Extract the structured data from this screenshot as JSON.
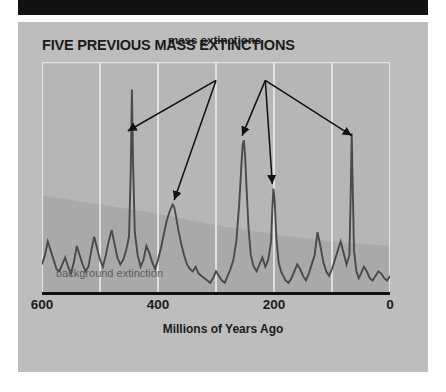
{
  "figure": {
    "title": "FIVE PREVIOUS MASS EXTINCTIONS",
    "annotation_label": "mass extinctions",
    "background_label": "background extinction",
    "axis_caption": "Millions of Years Ago",
    "colors": {
      "banner": "#121212",
      "panel": "#bdbdbd",
      "gridline": "#e3e3e3",
      "curve": "#4a4a4a",
      "band": "#a9a9a9",
      "axis": "#111111",
      "text": "#1b1b1b",
      "muted_text": "#5c5c5c"
    }
  },
  "chart_data": {
    "type": "line",
    "title": "FIVE PREVIOUS MASS EXTINCTIONS",
    "xlabel": "Millions of Years Ago",
    "ylabel": "",
    "xlim": [
      600,
      0
    ],
    "ylim": [
      0,
      100
    ],
    "x_ticks": [
      600,
      400,
      200,
      0
    ],
    "x_tick_labels": [
      "600",
      "400",
      "200",
      "0"
    ],
    "gridlines_x": [
      600,
      500,
      400,
      300,
      200,
      100,
      0
    ],
    "grid": true,
    "legend": "none",
    "annotations": [
      {
        "text": "mass extinctions",
        "x": 300,
        "y": 96
      },
      {
        "text": "background extinction",
        "x": 520,
        "y": 8
      }
    ],
    "arrows": [
      {
        "from_x": 300,
        "from_y": 92,
        "to_x": 452,
        "to_y": 70
      },
      {
        "from_x": 300,
        "from_y": 92,
        "to_x": 372,
        "to_y": 40
      },
      {
        "from_x": 215,
        "from_y": 92,
        "to_x": 255,
        "to_y": 68
      },
      {
        "from_x": 215,
        "from_y": 92,
        "to_x": 203,
        "to_y": 47
      },
      {
        "from_x": 215,
        "from_y": 92,
        "to_x": 66,
        "to_y": 68
      }
    ],
    "mass_extinction_events": [
      {
        "name": "Ordovician",
        "x": 445,
        "y": 88
      },
      {
        "name": "Devonian",
        "x": 372,
        "y": 38
      },
      {
        "name": "Permian",
        "x": 252,
        "y": 66
      },
      {
        "name": "Triassic",
        "x": 201,
        "y": 45
      },
      {
        "name": "Cretaceous",
        "x": 66,
        "y": 69
      }
    ],
    "background_band": {
      "description": "shaded background extinction envelope declining left to right",
      "x": [
        600,
        500,
        400,
        300,
        200,
        100,
        0
      ],
      "y_top": [
        42,
        38,
        34,
        29,
        25,
        22,
        20
      ]
    },
    "series": [
      {
        "name": "extinction intensity",
        "x": [
          600,
          595,
          590,
          585,
          580,
          575,
          570,
          565,
          560,
          555,
          550,
          545,
          540,
          535,
          530,
          525,
          520,
          515,
          510,
          505,
          500,
          495,
          490,
          485,
          480,
          475,
          470,
          465,
          460,
          455,
          450,
          447,
          445,
          443,
          440,
          435,
          430,
          425,
          420,
          415,
          410,
          405,
          400,
          395,
          390,
          385,
          380,
          375,
          372,
          369,
          365,
          360,
          355,
          350,
          345,
          340,
          335,
          330,
          325,
          320,
          315,
          310,
          305,
          300,
          295,
          290,
          285,
          280,
          275,
          270,
          265,
          260,
          256,
          254,
          252,
          250,
          247,
          244,
          240,
          235,
          230,
          225,
          220,
          215,
          210,
          205,
          203,
          201,
          199,
          196,
          192,
          188,
          184,
          180,
          175,
          170,
          165,
          160,
          155,
          150,
          145,
          140,
          135,
          130,
          125,
          120,
          115,
          110,
          105,
          100,
          95,
          90,
          85,
          80,
          75,
          70,
          68,
          66,
          64,
          62,
          58,
          54,
          50,
          45,
          40,
          35,
          30,
          25,
          20,
          15,
          10,
          5,
          0
        ],
        "y": [
          12,
          16,
          22,
          18,
          14,
          10,
          9,
          12,
          15,
          11,
          8,
          13,
          20,
          16,
          12,
          9,
          11,
          18,
          24,
          19,
          14,
          11,
          16,
          22,
          27,
          21,
          15,
          12,
          14,
          18,
          24,
          52,
          88,
          55,
          26,
          16,
          11,
          14,
          20,
          17,
          13,
          10,
          14,
          19,
          25,
          31,
          35,
          38,
          37,
          33,
          27,
          21,
          16,
          12,
          10,
          9,
          11,
          8,
          7,
          6,
          5,
          4,
          6,
          9,
          7,
          5,
          4,
          7,
          10,
          14,
          22,
          38,
          56,
          64,
          66,
          60,
          44,
          28,
          16,
          11,
          9,
          12,
          15,
          11,
          14,
          22,
          36,
          45,
          40,
          24,
          13,
          9,
          7,
          5,
          4,
          6,
          9,
          12,
          10,
          7,
          5,
          8,
          12,
          16,
          26,
          20,
          13,
          9,
          7,
          10,
          14,
          18,
          22,
          17,
          12,
          16,
          40,
          69,
          42,
          18,
          9,
          6,
          8,
          11,
          9,
          6,
          5,
          7,
          9,
          8,
          6,
          5,
          7
        ]
      }
    ]
  }
}
